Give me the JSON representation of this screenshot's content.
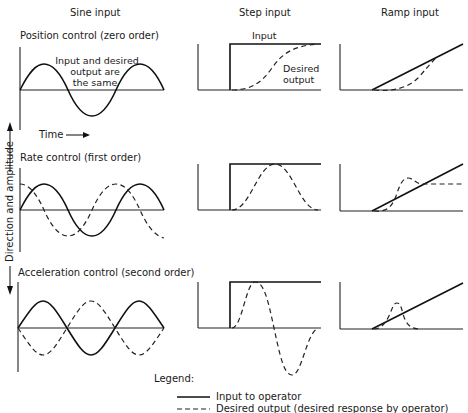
{
  "columns": {
    "sine": "Sine input",
    "step": "Step input",
    "ramp": "Ramp input"
  },
  "rows": [
    {
      "label": "Position control (zero order)"
    },
    {
      "label": "Rate control (first order)"
    },
    {
      "label": "Acceleration control (second order)"
    }
  ],
  "annotations": {
    "same_line1": "Input and desired",
    "same_line2": "output are",
    "same_line3": "the same",
    "step_input": "Input",
    "desired_line1": "Desired",
    "desired_line2": "output",
    "time": "Time",
    "y_axis": "Direction and amplitude"
  },
  "legend": {
    "title": "Legend:",
    "items": [
      {
        "style": "solid",
        "label": "Input to operator"
      },
      {
        "style": "dashed",
        "label": "Desired output (desired response by operator)"
      }
    ]
  },
  "colors": {
    "ink": "#111111",
    "background": "#ffffff"
  }
}
